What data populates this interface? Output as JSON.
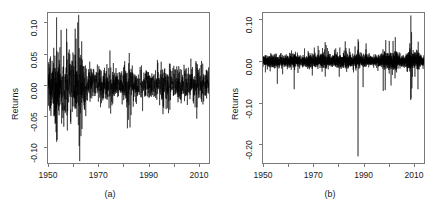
{
  "figure": {
    "background": "#ffffff",
    "line_color": "#000000",
    "axis_color": "#7a7a7a",
    "text_color": "#1a1a1a"
  },
  "chart_data": [
    {
      "type": "line",
      "panel_id": "a",
      "caption": "(a)",
      "title": "",
      "xlabel": "",
      "ylabel": "Returns",
      "xlim": [
        1950,
        2014
      ],
      "ylim": [
        -0.125,
        0.115
      ],
      "xticks": [
        1950,
        1970,
        1990,
        2010
      ],
      "xticklabels": [
        "1950",
        "1970",
        "1990",
        "2010"
      ],
      "xminorticks": [
        1960,
        1980,
        2000
      ],
      "yticks": [
        -0.1,
        -0.05,
        0.0,
        0.05,
        0.1
      ],
      "yticklabels": [
        "-0.10",
        "-0.05",
        "0.00",
        "0.05",
        "0.10"
      ],
      "grid": false,
      "legend": null,
      "description": "Monthly stock index returns 1950-2014; high volatility clustering in the 1950s and early 1960s with peaks near +0.11 and troughs near -0.12, calmer regime after 1965 with volatility bursts around 1974, 1982, 1987, 1998, 2002 and 2008.",
      "seed": 20240917,
      "n_points": 1540,
      "baseline": 0.0,
      "volatility_profile": [
        {
          "x": 1950.0,
          "sigma": 0.02
        },
        {
          "x": 1951.5,
          "sigma": 0.021
        },
        {
          "x": 1953.0,
          "sigma": 0.034
        },
        {
          "x": 1954.0,
          "sigma": 0.03
        },
        {
          "x": 1955.5,
          "sigma": 0.026
        },
        {
          "x": 1957.0,
          "sigma": 0.031
        },
        {
          "x": 1958.0,
          "sigma": 0.025
        },
        {
          "x": 1959.5,
          "sigma": 0.027
        },
        {
          "x": 1961.5,
          "sigma": 0.036
        },
        {
          "x": 1962.5,
          "sigma": 0.038
        },
        {
          "x": 1963.5,
          "sigma": 0.025
        },
        {
          "x": 1965.0,
          "sigma": 0.016
        },
        {
          "x": 1968.0,
          "sigma": 0.014
        },
        {
          "x": 1970.0,
          "sigma": 0.015
        },
        {
          "x": 1972.0,
          "sigma": 0.013
        },
        {
          "x": 1974.5,
          "sigma": 0.02
        },
        {
          "x": 1976.0,
          "sigma": 0.013
        },
        {
          "x": 1979.0,
          "sigma": 0.013
        },
        {
          "x": 1982.0,
          "sigma": 0.019
        },
        {
          "x": 1984.0,
          "sigma": 0.012
        },
        {
          "x": 1987.5,
          "sigma": 0.014
        },
        {
          "x": 1990.0,
          "sigma": 0.013
        },
        {
          "x": 1994.0,
          "sigma": 0.013
        },
        {
          "x": 1996.5,
          "sigma": 0.015
        },
        {
          "x": 1998.5,
          "sigma": 0.016
        },
        {
          "x": 2001.0,
          "sigma": 0.015
        },
        {
          "x": 2003.0,
          "sigma": 0.013
        },
        {
          "x": 2006.0,
          "sigma": 0.012
        },
        {
          "x": 2008.5,
          "sigma": 0.016
        },
        {
          "x": 2010.0,
          "sigma": 0.014
        },
        {
          "x": 2012.0,
          "sigma": 0.013
        },
        {
          "x": 2014.0,
          "sigma": 0.013
        }
      ],
      "spikes": [
        {
          "x": 1953.4,
          "y": 0.108
        },
        {
          "x": 1953.6,
          "y": -0.088
        },
        {
          "x": 1955.2,
          "y": 0.088
        },
        {
          "x": 1955.4,
          "y": -0.062
        },
        {
          "x": 1957.4,
          "y": 0.09
        },
        {
          "x": 1957.7,
          "y": -0.073
        },
        {
          "x": 1959.0,
          "y": -0.058
        },
        {
          "x": 1961.8,
          "y": 0.1
        },
        {
          "x": 1962.2,
          "y": 0.112
        },
        {
          "x": 1962.4,
          "y": -0.098
        },
        {
          "x": 1962.6,
          "y": -0.122
        },
        {
          "x": 1963.1,
          "y": -0.082
        },
        {
          "x": 1965.0,
          "y": -0.05
        },
        {
          "x": 1970.2,
          "y": 0.03
        },
        {
          "x": 1974.6,
          "y": 0.055
        },
        {
          "x": 1974.9,
          "y": -0.046
        },
        {
          "x": 1976.0,
          "y": 0.035
        },
        {
          "x": 1980.5,
          "y": 0.038
        },
        {
          "x": 1982.3,
          "y": 0.051
        },
        {
          "x": 1982.6,
          "y": -0.068
        },
        {
          "x": 1987.6,
          "y": -0.042
        },
        {
          "x": 1993.5,
          "y": 0.04
        },
        {
          "x": 1995.0,
          "y": 0.037
        },
        {
          "x": 1998.3,
          "y": 0.034
        },
        {
          "x": 2002.0,
          "y": 0.03
        },
        {
          "x": 2006.8,
          "y": 0.042
        },
        {
          "x": 2008.8,
          "y": 0.038
        },
        {
          "x": 2009.2,
          "y": -0.036
        },
        {
          "x": 2011.5,
          "y": 0.034
        }
      ]
    },
    {
      "type": "line",
      "panel_id": "b",
      "caption": "(b)",
      "title": "",
      "xlabel": "",
      "ylabel": "Returns",
      "xlim": [
        1950,
        2014
      ],
      "ylim": [
        -0.245,
        0.115
      ],
      "xticks": [
        1950,
        1970,
        1990,
        2010
      ],
      "xticklabels": [
        "1950",
        "1970",
        "1990",
        "2010"
      ],
      "xminorticks": [
        1960,
        1980,
        2000
      ],
      "yticks": [
        -0.2,
        -0.1,
        0.0,
        0.1
      ],
      "yticklabels": [
        "-0.20",
        "-0.10",
        "0.00",
        "0.10"
      ],
      "grid": false,
      "legend": null,
      "description": "Daily stock index returns 1950-2014; single extreme negative outlier of about -0.23 at the October 1987 crash, elevated volatility around 2008-2009 reaching +0.11 and -0.095.",
      "seed": 771103,
      "n_points": 3200,
      "baseline": 0.0,
      "volatility_profile": [
        {
          "x": 1950.0,
          "sigma": 0.0072
        },
        {
          "x": 1953.0,
          "sigma": 0.007
        },
        {
          "x": 1956.0,
          "sigma": 0.0078
        },
        {
          "x": 1960.0,
          "sigma": 0.0074
        },
        {
          "x": 1962.5,
          "sigma": 0.0088
        },
        {
          "x": 1965.0,
          "sigma": 0.0062
        },
        {
          "x": 1970.0,
          "sigma": 0.008
        },
        {
          "x": 1974.5,
          "sigma": 0.0098
        },
        {
          "x": 1977.0,
          "sigma": 0.007
        },
        {
          "x": 1980.5,
          "sigma": 0.0088
        },
        {
          "x": 1982.5,
          "sigma": 0.009
        },
        {
          "x": 1985.0,
          "sigma": 0.007
        },
        {
          "x": 1987.8,
          "sigma": 0.0105
        },
        {
          "x": 1989.5,
          "sigma": 0.0072
        },
        {
          "x": 1992.0,
          "sigma": 0.0062
        },
        {
          "x": 1995.0,
          "sigma": 0.006
        },
        {
          "x": 1998.5,
          "sigma": 0.0098
        },
        {
          "x": 2000.5,
          "sigma": 0.0112
        },
        {
          "x": 2002.5,
          "sigma": 0.0118
        },
        {
          "x": 2004.5,
          "sigma": 0.0072
        },
        {
          "x": 2006.5,
          "sigma": 0.0064
        },
        {
          "x": 2008.6,
          "sigma": 0.0165
        },
        {
          "x": 2009.4,
          "sigma": 0.014
        },
        {
          "x": 2010.5,
          "sigma": 0.0092
        },
        {
          "x": 2011.7,
          "sigma": 0.0105
        },
        {
          "x": 2013.0,
          "sigma": 0.0068
        },
        {
          "x": 2014.0,
          "sigma": 0.0066
        }
      ],
      "spikes": [
        {
          "x": 1955.7,
          "y": -0.055
        },
        {
          "x": 1957.8,
          "y": -0.032
        },
        {
          "x": 1962.4,
          "y": -0.068
        },
        {
          "x": 1963.9,
          "y": -0.029
        },
        {
          "x": 1966.5,
          "y": 0.03
        },
        {
          "x": 1970.4,
          "y": 0.032
        },
        {
          "x": 1971.9,
          "y": 0.036
        },
        {
          "x": 1974.7,
          "y": 0.045
        },
        {
          "x": 1975.1,
          "y": 0.038
        },
        {
          "x": 1978.9,
          "y": 0.03
        },
        {
          "x": 1980.3,
          "y": -0.038
        },
        {
          "x": 1982.7,
          "y": 0.047
        },
        {
          "x": 1984.3,
          "y": 0.03
        },
        {
          "x": 1986.6,
          "y": 0.035
        },
        {
          "x": 1987.78,
          "y": -0.229
        },
        {
          "x": 1987.82,
          "y": 0.052
        },
        {
          "x": 1988.0,
          "y": 0.046
        },
        {
          "x": 1989.8,
          "y": -0.063
        },
        {
          "x": 1991.0,
          "y": 0.042
        },
        {
          "x": 1997.8,
          "y": -0.072
        },
        {
          "x": 1998.6,
          "y": -0.07
        },
        {
          "x": 1998.8,
          "y": 0.05
        },
        {
          "x": 2000.2,
          "y": 0.048
        },
        {
          "x": 2000.9,
          "y": -0.059
        },
        {
          "x": 2001.7,
          "y": 0.048
        },
        {
          "x": 2002.5,
          "y": -0.042
        },
        {
          "x": 2002.6,
          "y": 0.057
        },
        {
          "x": 2008.72,
          "y": -0.094
        },
        {
          "x": 2008.78,
          "y": 0.109
        },
        {
          "x": 2008.86,
          "y": -0.09
        },
        {
          "x": 2009.05,
          "y": 0.069
        },
        {
          "x": 2009.2,
          "y": -0.066
        },
        {
          "x": 2010.4,
          "y": -0.038
        },
        {
          "x": 2011.6,
          "y": -0.068
        },
        {
          "x": 2011.7,
          "y": 0.046
        }
      ]
    }
  ]
}
